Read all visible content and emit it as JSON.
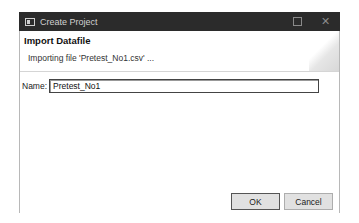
{
  "window": {
    "title": "Create Project",
    "icons": {
      "app": "app-window-icon",
      "maximize": "maximize-icon",
      "close": "close-icon"
    },
    "close_glyph": "✕"
  },
  "banner": {
    "title": "Import Datafile",
    "message": "Importing file 'Pretest_No1.csv' ..."
  },
  "form": {
    "name_label": "Name:",
    "name_value": "Pretest_No1"
  },
  "buttons": {
    "ok": "OK",
    "cancel": "Cancel"
  },
  "colors": {
    "titlebar": "#2b2b2b",
    "button_bg": "#e1e1e1"
  }
}
